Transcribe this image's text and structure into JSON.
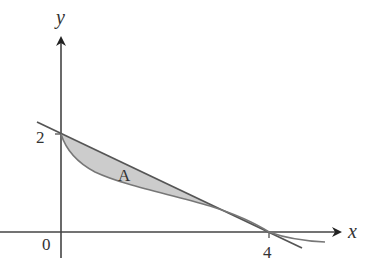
{
  "diagram": {
    "type": "area-between-curves",
    "axes": {
      "x_label": "x",
      "y_label": "y",
      "origin_label": "0",
      "x_tick_label": "4",
      "y_tick_label": "2"
    },
    "region_label": "A",
    "curves": [
      {
        "name": "straight-line",
        "from": [
          0,
          2
        ],
        "to": [
          4,
          0
        ]
      },
      {
        "name": "convex-curve",
        "from": [
          0,
          2
        ],
        "to": [
          4,
          0
        ]
      }
    ],
    "colors": {
      "fill": "#cccccc",
      "stroke": "#555555",
      "axis": "#333333"
    }
  }
}
